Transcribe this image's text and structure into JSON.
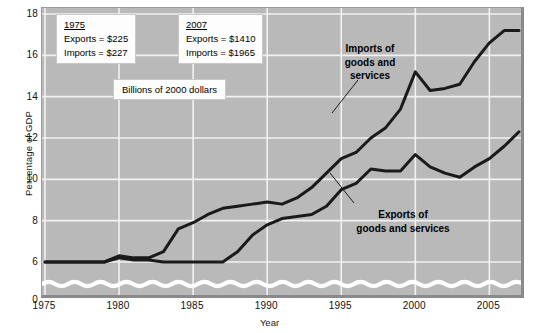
{
  "chart_data": {
    "type": "line",
    "title": "",
    "xlabel": "Year",
    "ylabel": "Percentage of GDP",
    "xlim": [
      1975,
      2007
    ],
    "ylim": [
      0,
      18
    ],
    "y_axis_break": true,
    "y_break_between": [
      0,
      6
    ],
    "grid": true,
    "legend_position": "inline-annotation",
    "yticks": [
      0,
      6,
      8,
      10,
      12,
      14,
      16,
      18
    ],
    "ytick_labels": [
      "0",
      "6",
      "8",
      "10",
      "12",
      "14",
      "16",
      "18"
    ],
    "xticks": [
      1975,
      1980,
      1985,
      1990,
      1995,
      2000,
      2005
    ],
    "xtick_labels": [
      "1975",
      "1980",
      "1985",
      "1990",
      "1995",
      "2000",
      "2005"
    ],
    "x": [
      1975,
      1976,
      1977,
      1978,
      1979,
      1980,
      1981,
      1982,
      1983,
      1984,
      1985,
      1986,
      1987,
      1988,
      1989,
      1990,
      1991,
      1992,
      1993,
      1994,
      1995,
      1996,
      1997,
      1998,
      1999,
      2000,
      2001,
      2002,
      2003,
      2004,
      2005,
      2006,
      2007
    ],
    "series": [
      {
        "name": "Imports of goods and services",
        "values": [
          4.3,
          4.5,
          5.0,
          5.3,
          5.9,
          6.3,
          6.2,
          6.2,
          6.5,
          7.6,
          7.9,
          8.3,
          8.6,
          8.7,
          8.8,
          8.9,
          8.8,
          9.1,
          9.6,
          10.3,
          11.0,
          11.3,
          12.0,
          12.5,
          13.4,
          15.2,
          14.3,
          14.4,
          14.6,
          15.7,
          16.6,
          17.2,
          17.2
        ]
      },
      {
        "name": "Exports of goods and services",
        "values": [
          4.3,
          4.2,
          4.1,
          4.6,
          5.6,
          6.2,
          6.1,
          6.1,
          5.6,
          5.0,
          5.1,
          5.1,
          5.6,
          6.5,
          7.3,
          7.8,
          8.1,
          8.2,
          8.3,
          8.7,
          9.5,
          9.8,
          10.5,
          10.4,
          10.4,
          11.2,
          10.6,
          10.3,
          10.1,
          10.6,
          11.0,
          11.6,
          12.3
        ]
      }
    ],
    "annotations": {
      "box_1975": {
        "title": "1975",
        "line1": "Exports  =  $225",
        "line2": "Imports  =  $227"
      },
      "box_2007": {
        "title": "2007",
        "line1": "Exports  =  $1410",
        "line2": "Imports  =  $1965"
      },
      "units_note": "Billions of 2000 dollars",
      "imports_label": "Imports of\ngoods and\nservices",
      "imports_label_lines": [
        "Imports of",
        "goods and",
        "services"
      ],
      "exports_label": "Exports of\ngoods and services",
      "exports_label_lines": [
        "Exports of",
        "goods and services"
      ]
    },
    "colors": {
      "plot_background": "#b9b9b9",
      "gridlines": "#f2f2f2",
      "series_line": "#1a1a1a",
      "break_squiggle": "#ffffff",
      "page_background": "#ffffff",
      "text": "#111111",
      "callout_background": "#fdfdfd"
    }
  }
}
